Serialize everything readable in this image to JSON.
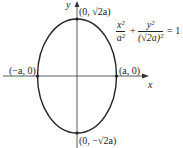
{
  "diagram": {
    "type": "ellipse-graph",
    "axes": {
      "x_label": "x",
      "y_label": "y"
    },
    "points": {
      "top": "(0, √2a)",
      "bottom": "(0, −√2a)",
      "left": "(−a, 0)",
      "right": "(a, 0)"
    },
    "equation": {
      "term1_num": "x²",
      "term1_den": "a²",
      "plus": "+",
      "term2_num": "y²",
      "term2_den": "(√2a)²",
      "rhs": "= 1"
    },
    "colors": {
      "stroke": "#222222",
      "background": "#ffffff"
    }
  }
}
